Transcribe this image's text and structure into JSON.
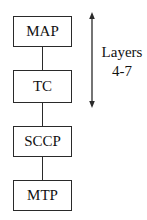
{
  "diagram": {
    "type": "protocol-stack",
    "layers": [
      {
        "id": "map",
        "label": "MAP"
      },
      {
        "id": "tc",
        "label": "TC"
      },
      {
        "id": "sccp",
        "label": "SCCP"
      },
      {
        "id": "mtp",
        "label": "MTP"
      }
    ],
    "connections": [
      {
        "from": "MAP",
        "to": "TC"
      },
      {
        "from": "TC",
        "to": "SCCP"
      },
      {
        "from": "SCCP",
        "to": "MTP"
      }
    ],
    "bracket": {
      "spans": [
        "MAP",
        "TC"
      ],
      "label_line1": "Layers",
      "label_line2": "4-7",
      "style": "double-headed-arrow"
    },
    "colors": {
      "stroke": "#2a2a2a",
      "text": "#111111",
      "background": "#ffffff"
    }
  }
}
